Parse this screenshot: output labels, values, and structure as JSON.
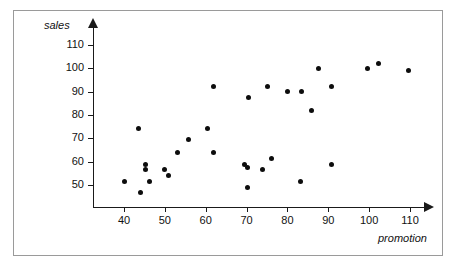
{
  "chart_data": {
    "type": "scatter",
    "title": "",
    "xlabel": "promotion",
    "ylabel": "sales",
    "xlim": [
      32,
      115
    ],
    "ylim": [
      44,
      114
    ],
    "grid": false,
    "legend": null,
    "xticks": [
      40,
      50,
      60,
      70,
      80,
      90,
      100,
      110
    ],
    "yticks": [
      50,
      60,
      70,
      80,
      90,
      100,
      110
    ],
    "xtick_labels": [
      "40",
      "50",
      "60",
      "70",
      "80",
      "90",
      "100",
      "110"
    ],
    "ytick_labels": [
      "50",
      "60",
      "70",
      "80",
      "90",
      "100",
      "110"
    ],
    "marker": "filled-circle",
    "marker_color": "#0d0d0d",
    "axis_color": "#1a1a1a",
    "frame_color": "#9a9a9a",
    "background": "#ffffff",
    "points": [
      {
        "x": 40.2,
        "y": 51.4
      },
      {
        "x": 43.6,
        "y": 74.4
      },
      {
        "x": 44.1,
        "y": 46.7
      },
      {
        "x": 45.2,
        "y": 58.9
      },
      {
        "x": 45.2,
        "y": 56.7
      },
      {
        "x": 46.3,
        "y": 51.4
      },
      {
        "x": 49.8,
        "y": 56.7
      },
      {
        "x": 51.0,
        "y": 54.1
      },
      {
        "x": 53.0,
        "y": 63.9
      },
      {
        "x": 55.7,
        "y": 69.5
      },
      {
        "x": 60.5,
        "y": 74.4
      },
      {
        "x": 61.8,
        "y": 92.4
      },
      {
        "x": 61.9,
        "y": 63.9
      },
      {
        "x": 69.4,
        "y": 58.6
      },
      {
        "x": 70.3,
        "y": 57.7
      },
      {
        "x": 70.3,
        "y": 48.9
      },
      {
        "x": 70.5,
        "y": 87.3
      },
      {
        "x": 74.0,
        "y": 56.7
      },
      {
        "x": 75.2,
        "y": 92.4
      },
      {
        "x": 76.2,
        "y": 61.4
      },
      {
        "x": 79.9,
        "y": 90.0
      },
      {
        "x": 83.3,
        "y": 51.4
      },
      {
        "x": 83.4,
        "y": 90.0
      },
      {
        "x": 86.0,
        "y": 82.0
      },
      {
        "x": 87.7,
        "y": 100.0
      },
      {
        "x": 90.7,
        "y": 92.4
      },
      {
        "x": 90.8,
        "y": 58.6
      },
      {
        "x": 99.7,
        "y": 100.0
      },
      {
        "x": 102.2,
        "y": 102.2
      },
      {
        "x": 109.6,
        "y": 98.9
      }
    ]
  }
}
